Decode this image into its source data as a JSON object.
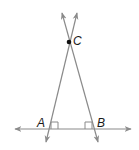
{
  "diagram": {
    "colors": {
      "line": "#8a8a8a",
      "point": "#111111",
      "label": "#1a1a1a",
      "background": "#ffffff"
    },
    "points": [
      {
        "id": "C",
        "label": "C",
        "x": 69,
        "y": 42
      },
      {
        "id": "A",
        "label": "A",
        "x": 49,
        "y": 129
      },
      {
        "id": "B",
        "label": "B",
        "x": 94,
        "y": 129
      }
    ],
    "lines": [
      {
        "name": "horizontal-line",
        "x1": 15,
        "y1": 129,
        "x2": 131,
        "y2": 129,
        "arrows": "both"
      },
      {
        "name": "line-through-A-and-C",
        "x1": 77,
        "y1": 13,
        "x2": 46,
        "y2": 142,
        "arrows": "both"
      },
      {
        "name": "line-through-B-and-C",
        "x1": 62,
        "y1": 13,
        "x2": 98,
        "y2": 142,
        "arrows": "both"
      }
    ],
    "right_angle_marks": [
      {
        "at": "A",
        "side": "right"
      },
      {
        "at": "B",
        "side": "left"
      }
    ]
  }
}
